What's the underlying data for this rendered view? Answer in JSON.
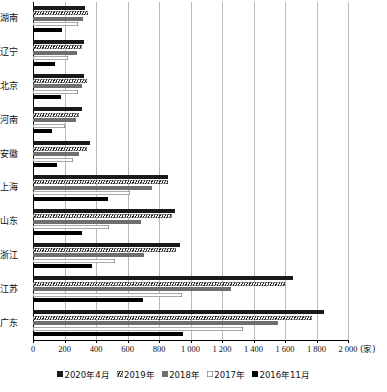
{
  "chart_data": {
    "type": "bar",
    "orientation": "horizontal",
    "title": "",
    "xlabel": "(家)",
    "ylabel": "",
    "xlim": [
      0,
      2000
    ],
    "grid": true,
    "legend_position": "bottom",
    "xticks": [
      "0",
      "200",
      "400",
      "600",
      "800",
      "1 000",
      "1 200",
      "1 400",
      "1 600",
      "1 800",
      "2 000"
    ],
    "xtick_values": [
      0,
      200,
      400,
      600,
      800,
      1000,
      1200,
      1400,
      1600,
      1800,
      2000
    ],
    "unit_label": "(家)",
    "categories": [
      "湖南",
      "辽宁",
      "北京",
      "河南",
      "安徽",
      "上海",
      "山东",
      "浙江",
      "江苏",
      "广东"
    ],
    "series": [
      {
        "name": "2020年4月",
        "values": [
          330,
          322,
          325,
          310,
          360,
          855,
          900,
          935,
          1650,
          1850
        ]
      },
      {
        "name": "2019年",
        "values": [
          348,
          310,
          340,
          290,
          340,
          855,
          880,
          910,
          1600,
          1770
        ]
      },
      {
        "name": "2018年",
        "values": [
          318,
          282,
          310,
          275,
          295,
          755,
          685,
          705,
          1260,
          1555
        ]
      },
      {
        "name": "2017年",
        "values": [
          285,
          225,
          288,
          200,
          255,
          615,
          485,
          520,
          945,
          1335
        ]
      },
      {
        "name": "2016年11月",
        "values": [
          185,
          140,
          175,
          120,
          155,
          475,
          310,
          375,
          700,
          955
        ]
      }
    ]
  }
}
